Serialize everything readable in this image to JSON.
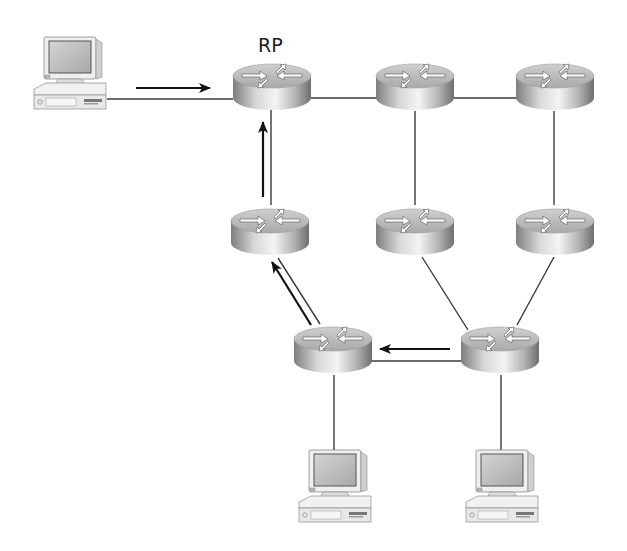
{
  "diagram": {
    "type": "network-topology",
    "labels": {
      "rp": "RP"
    },
    "nodes": [
      {
        "id": "pc-source",
        "kind": "workstation"
      },
      {
        "id": "r-rp",
        "kind": "router",
        "label_key": "rp"
      },
      {
        "id": "r-top-mid",
        "kind": "router"
      },
      {
        "id": "r-top-right",
        "kind": "router"
      },
      {
        "id": "r-mid-left",
        "kind": "router"
      },
      {
        "id": "r-mid-center",
        "kind": "router"
      },
      {
        "id": "r-mid-right",
        "kind": "router"
      },
      {
        "id": "r-bottom-left",
        "kind": "router"
      },
      {
        "id": "r-bottom-right",
        "kind": "router"
      },
      {
        "id": "pc-receiver-left",
        "kind": "workstation"
      },
      {
        "id": "pc-receiver-right",
        "kind": "workstation"
      }
    ],
    "links": [
      {
        "from": "pc-source",
        "to": "r-rp"
      },
      {
        "from": "r-rp",
        "to": "r-top-mid"
      },
      {
        "from": "r-top-mid",
        "to": "r-top-right"
      },
      {
        "from": "r-rp",
        "to": "r-mid-left"
      },
      {
        "from": "r-top-mid",
        "to": "r-mid-center"
      },
      {
        "from": "r-top-right",
        "to": "r-mid-right"
      },
      {
        "from": "r-mid-left",
        "to": "r-bottom-left"
      },
      {
        "from": "r-mid-center",
        "to": "r-bottom-right"
      },
      {
        "from": "r-mid-right",
        "to": "r-bottom-right"
      },
      {
        "from": "r-bottom-left",
        "to": "r-bottom-right"
      },
      {
        "from": "r-bottom-left",
        "to": "pc-receiver-left"
      },
      {
        "from": "r-bottom-right",
        "to": "pc-receiver-right"
      }
    ],
    "flow_arrows": [
      {
        "from": "pc-source",
        "to": "r-rp"
      },
      {
        "from": "r-bottom-right",
        "to": "r-bottom-left"
      },
      {
        "from": "r-bottom-left",
        "to": "r-mid-left"
      },
      {
        "from": "r-mid-left",
        "to": "r-rp"
      }
    ],
    "colors": {
      "line": "#3a3a3a",
      "arrow": "#111111",
      "router_light": "#e6e6e6",
      "router_dark": "#8a8a8a",
      "pc_body": "#ececec",
      "pc_screen": "#bdbdbd"
    }
  }
}
